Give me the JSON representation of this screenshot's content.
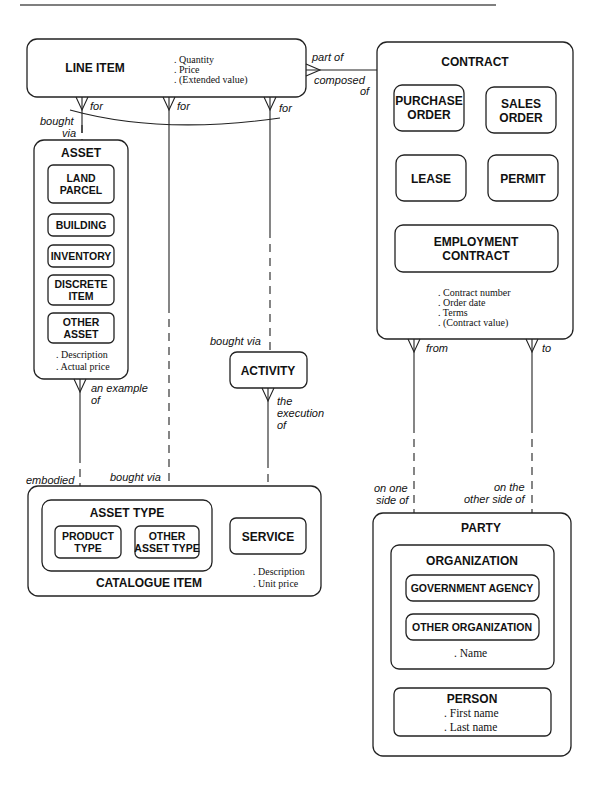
{
  "diagram": {
    "type": "entity-relationship",
    "entities": {
      "line_item": {
        "name": "LINE ITEM",
        "attributes": [
          ". Quantity",
          ". Price",
          ". (Extended value)"
        ]
      },
      "contract": {
        "name": "CONTRACT",
        "subtypes": {
          "purchase_order": [
            "PURCHASE",
            "ORDER"
          ],
          "sales_order": [
            "SALES",
            "ORDER"
          ],
          "lease": "LEASE",
          "permit": "PERMIT",
          "employment_contract": [
            "EMPLOYMENT",
            "CONTRACT"
          ]
        },
        "attributes": [
          ". Contract number",
          ". Order date",
          ". Terms",
          ". (Contract value)"
        ]
      },
      "asset": {
        "name": "ASSET",
        "subtypes": {
          "land_parcel": [
            "LAND",
            "PARCEL"
          ],
          "building": "BUILDING",
          "inventory": "INVENTORY",
          "discrete_item": [
            "DISCRETE",
            "ITEM"
          ],
          "other_asset": [
            "OTHER",
            "ASSET"
          ]
        },
        "attributes": [
          ". Description",
          ". Actual price"
        ]
      },
      "activity": {
        "name": "ACTIVITY"
      },
      "catalogue_item": {
        "name": "CATALOGUE ITEM",
        "asset_type": {
          "name": "ASSET TYPE",
          "product_type": [
            "PRODUCT",
            "TYPE"
          ],
          "other_asset_type": [
            "OTHER",
            "ASSET TYPE"
          ]
        },
        "service": "SERVICE",
        "attributes": [
          ". Description",
          ". Unit price"
        ]
      },
      "party": {
        "name": "PARTY",
        "organization": {
          "name": "ORGANIZATION",
          "government_agency": "GOVERNMENT AGENCY",
          "other_organization": "OTHER ORGANIZATION",
          "attributes": [
            ". Name"
          ]
        },
        "person": {
          "name": "PERSON",
          "attributes": [
            ". First name",
            ". Last name"
          ]
        }
      }
    },
    "relationships": {
      "line_item_contract": {
        "from_label": "part of",
        "to_label": [
          "composed",
          "of"
        ]
      },
      "line_item_asset": {
        "from_label": "for",
        "to_label": [
          "bought",
          "via"
        ]
      },
      "line_item_catalogue": {
        "from_label": "for",
        "to_label": "bought via"
      },
      "line_item_activity": {
        "from_label": "for",
        "to_label": "bought via"
      },
      "asset_asset_type": {
        "from_label": [
          "an example",
          "of"
        ],
        "to_label": [
          "embodied",
          "in"
        ]
      },
      "activity_service": {
        "from_label": [
          "the",
          "execution",
          "of"
        ],
        "to_label": [
          "carried",
          "out in"
        ]
      },
      "contract_party_from": {
        "from_label": "from",
        "to_label": [
          "on one",
          "side of"
        ]
      },
      "contract_party_to": {
        "from_label": "to",
        "to_label": [
          "on the",
          "other side of"
        ]
      }
    }
  }
}
